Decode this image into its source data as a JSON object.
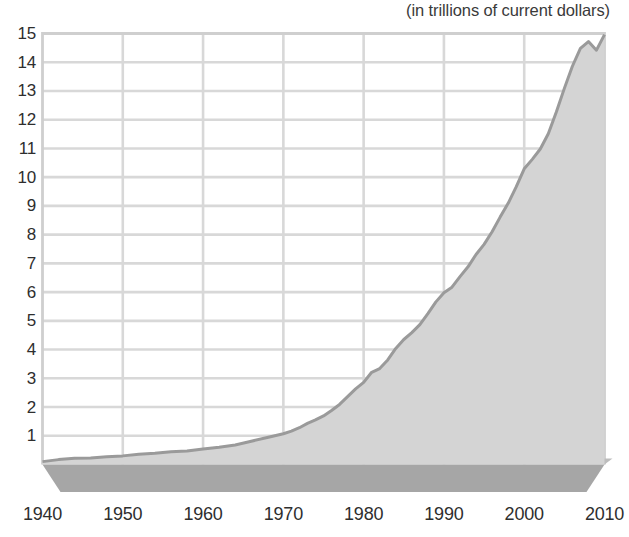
{
  "subtitle": "(in trillions of current dollars)",
  "colors": {
    "area_fill": "#d4d4d4",
    "area_line": "#9a9a9a",
    "base_top": "#bdbdbd",
    "base_front": "#a6a6a6",
    "base_side": "#9b9b9b",
    "grid": "#d8d8d8",
    "frame": "#cfcfcf",
    "text": "#2e2e2e",
    "background": "#ffffff"
  },
  "chart_data": {
    "type": "area",
    "title": "",
    "subtitle": "(in trillions of current dollars)",
    "xlabel": "",
    "ylabel": "",
    "xlim": [
      1940,
      2010
    ],
    "ylim": [
      0,
      15
    ],
    "grid": true,
    "legend": "none",
    "xticks": [
      1940,
      1950,
      1960,
      1970,
      1980,
      1990,
      2000,
      2010
    ],
    "yticks": [
      1,
      2,
      3,
      4,
      5,
      6,
      7,
      8,
      9,
      10,
      11,
      12,
      13,
      14,
      15
    ],
    "series": [
      {
        "name": "Gross domestic product",
        "x": [
          1940,
          1942,
          1944,
          1946,
          1948,
          1950,
          1952,
          1954,
          1956,
          1958,
          1960,
          1962,
          1964,
          1966,
          1968,
          1970,
          1971,
          1972,
          1973,
          1974,
          1975,
          1976,
          1977,
          1978,
          1979,
          1980,
          1981,
          1982,
          1983,
          1984,
          1985,
          1986,
          1987,
          1988,
          1989,
          1990,
          1991,
          1992,
          1993,
          1994,
          1995,
          1996,
          1997,
          1998,
          1999,
          2000,
          2001,
          2002,
          2003,
          2004,
          2005,
          2006,
          2007,
          2008,
          2009,
          2010
        ],
        "values": [
          0.1,
          0.17,
          0.22,
          0.23,
          0.27,
          0.3,
          0.36,
          0.39,
          0.44,
          0.47,
          0.54,
          0.6,
          0.68,
          0.81,
          0.94,
          1.07,
          1.16,
          1.28,
          1.43,
          1.55,
          1.69,
          1.88,
          2.09,
          2.36,
          2.63,
          2.86,
          3.21,
          3.34,
          3.64,
          4.04,
          4.35,
          4.59,
          4.87,
          5.25,
          5.66,
          5.98,
          6.17,
          6.54,
          6.88,
          7.31,
          7.66,
          8.1,
          8.61,
          9.09,
          9.66,
          10.29,
          10.62,
          10.98,
          11.51,
          12.27,
          13.09,
          13.86,
          14.48,
          14.72,
          14.42,
          14.96
        ]
      }
    ]
  },
  "axes": {
    "y_labels": [
      "15",
      "14",
      "13",
      "12",
      "11",
      "10",
      "9",
      "8",
      "7",
      "6",
      "5",
      "4",
      "3",
      "2",
      "1"
    ],
    "x_labels": [
      "1940",
      "1950",
      "1960",
      "1970",
      "1980",
      "1990",
      "2000",
      "2010"
    ]
  }
}
